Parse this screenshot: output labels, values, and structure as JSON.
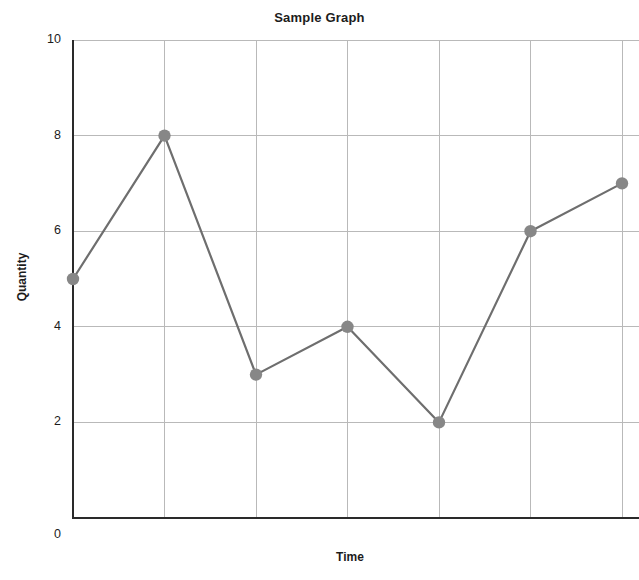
{
  "chart_data": {
    "type": "line",
    "title": "Sample Graph",
    "xlabel": "Time",
    "ylabel": "Quantity",
    "x": [
      0,
      1,
      2,
      3,
      4,
      5,
      6
    ],
    "values": [
      5,
      8,
      3,
      4,
      2,
      6,
      7
    ],
    "series": [
      {
        "name": "Quantity",
        "values": [
          5,
          8,
          3,
          4,
          2,
          6,
          7
        ]
      }
    ],
    "ylim": [
      0,
      10
    ],
    "yticks": [
      0,
      2,
      4,
      6,
      8,
      10
    ],
    "ytick_labels": [
      "0",
      "2",
      "4",
      "6",
      "8",
      "10"
    ],
    "xlim": [
      0,
      6
    ],
    "xticks": [
      0,
      1,
      2,
      3,
      4,
      5,
      6
    ],
    "xtick_labels": [
      "",
      "",
      "",
      "",
      "",
      "",
      ""
    ],
    "grid": true,
    "grid_axis": "both",
    "legend": "none",
    "marker": "circle",
    "line_color": "#6e6e6e",
    "marker_color": "#878787",
    "grid_color": "#b9b9b9",
    "axis_color": "#2a2a2a",
    "background": "#ffffff"
  }
}
